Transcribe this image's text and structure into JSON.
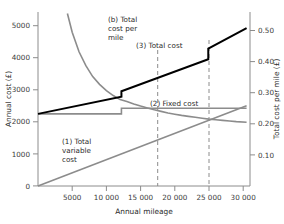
{
  "chart_data": {
    "type": "line",
    "title": "",
    "xlabel": "Annual mileage",
    "ylabel": "Annual cost (£)",
    "y2label": "Total cost per mile (£)",
    "xlim": [
      0,
      31000
    ],
    "ylim": [
      0,
      5600
    ],
    "y2lim": [
      0,
      0.56
    ],
    "grid": false,
    "legend": "annotations-inline",
    "xticks": [
      5000,
      10000,
      15000,
      20000,
      25000,
      30000
    ],
    "xticklabels": [
      "5000",
      "10 000",
      "15 000",
      "20 000",
      "25 000",
      "30 000"
    ],
    "yticks": [
      0,
      1000,
      2000,
      3000,
      4000,
      5000
    ],
    "yticklabels": [
      "0",
      "1000",
      "2000",
      "3000",
      "4000",
      "5000"
    ],
    "y2ticks": [
      0.1,
      0.2,
      0.3,
      0.4,
      0.5
    ],
    "y2ticklabels": [
      "0.10",
      "0.20",
      "0.30",
      "0.40",
      "0.50"
    ],
    "series": [
      {
        "name": "(1) Total variable cost",
        "axis": "left",
        "color": "#8c8c8c",
        "width": 1.6,
        "points": [
          [
            0,
            0
          ],
          [
            30500,
            2580
          ]
        ]
      },
      {
        "name": "(2) Fixed cost",
        "axis": "left",
        "color": "#8c8c8c",
        "width": 1.6,
        "points": [
          [
            0,
            2320
          ],
          [
            12200,
            2320
          ],
          [
            12200,
            2500
          ],
          [
            30500,
            2500
          ]
        ]
      },
      {
        "name": "(3) Total cost",
        "axis": "left",
        "color": "#000000",
        "width": 2.0,
        "points": [
          [
            0,
            2320
          ],
          [
            12200,
            2870
          ],
          [
            12200,
            3050
          ],
          [
            24900,
            4080
          ],
          [
            24900,
            4420
          ],
          [
            30500,
            5080
          ]
        ]
      },
      {
        "name": "(b) Total cost per mile",
        "axis": "right",
        "color": "#8c8c8c",
        "width": 1.6,
        "points": [
          [
            4300,
            0.555
          ],
          [
            5000,
            0.495
          ],
          [
            6000,
            0.432
          ],
          [
            7000,
            0.387
          ],
          [
            8000,
            0.352
          ],
          [
            9000,
            0.327
          ],
          [
            10000,
            0.307
          ],
          [
            11000,
            0.291
          ],
          [
            12000,
            0.278
          ],
          [
            13000,
            0.272
          ],
          [
            14000,
            0.264
          ],
          [
            15000,
            0.257
          ],
          [
            16000,
            0.251
          ],
          [
            17000,
            0.245
          ],
          [
            18000,
            0.24
          ],
          [
            19000,
            0.235
          ],
          [
            20000,
            0.231
          ],
          [
            21000,
            0.227
          ],
          [
            22000,
            0.224
          ],
          [
            23000,
            0.221
          ],
          [
            24000,
            0.218
          ],
          [
            25000,
            0.215
          ],
          [
            26000,
            0.213
          ],
          [
            27000,
            0.211
          ],
          [
            28000,
            0.209
          ],
          [
            29000,
            0.207
          ],
          [
            30500,
            0.205
          ]
        ]
      }
    ],
    "reference_lines": [
      {
        "name": "breakeven-17500",
        "x": 17500,
        "style": "dashed",
        "color": "#8c8c8c"
      },
      {
        "name": "breakeven-25000",
        "x": 25000,
        "style": "dashed",
        "color": "#8c8c8c"
      }
    ],
    "annotations": [
      {
        "id": "a_b",
        "text": "(b) Total\ncost per\nmile",
        "x": 108,
        "y": 18
      },
      {
        "id": "a_3",
        "text": "(3) Total cost",
        "x": 138,
        "y": 47
      },
      {
        "id": "a_2",
        "text": "(2) Fixed cost",
        "x": 151,
        "y": 106
      },
      {
        "id": "a_1",
        "text": "(1) Total\nvariable\ncost",
        "x": 62,
        "y": 140
      }
    ]
  },
  "labels": {
    "x_axis_title": "Annual mileage",
    "y_left_axis_title": "Annual cost (£)",
    "y_right_axis_title": "Total cost per mile (£)",
    "annotation_b_line1": "(b) Total",
    "annotation_b_line2": "cost per",
    "annotation_b_line3": "mile",
    "annotation_3": "(3) Total cost",
    "annotation_2": "(2) Fixed cost",
    "annotation_1_line1": "(1) Total",
    "annotation_1_line2": "variable",
    "annotation_1_line3": "cost",
    "x_tick_0": "5000",
    "x_tick_1": "10 000",
    "x_tick_2": "15 000",
    "x_tick_3": "20 000",
    "x_tick_4": "25 000",
    "x_tick_5": "30 000",
    "y_tick_0": "0",
    "y_tick_1": "1000",
    "y_tick_2": "2000",
    "y_tick_3": "3000",
    "y_tick_4": "4000",
    "y_tick_5": "5000",
    "y2_tick_0": "0.10",
    "y2_tick_1": "0.20",
    "y2_tick_2": "0.30",
    "y2_tick_3": "0.40",
    "y2_tick_4": "0.50"
  },
  "colors": {
    "axis": "#8c8c8c",
    "total_cost_line": "#000000",
    "gray_line": "#8c8c8c",
    "text": "#2b2b2b",
    "background": "#ffffff"
  }
}
